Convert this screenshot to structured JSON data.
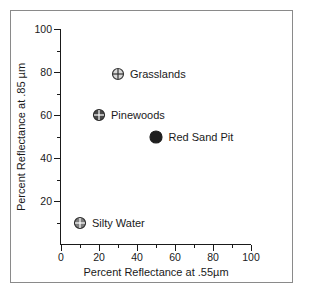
{
  "chart_data": {
    "type": "scatter",
    "title": "",
    "xlabel": "Percent Reflectance at .55µm",
    "ylabel": "Percent Reflectance at .85 µm",
    "xlim": [
      0,
      100
    ],
    "ylim": [
      0,
      100
    ],
    "grid": false,
    "legend": "inline-labels",
    "xticks": [
      {
        "value": 0,
        "label": "0"
      },
      {
        "value": 20,
        "label": "20"
      },
      {
        "value": 40,
        "label": "40"
      },
      {
        "value": 60,
        "label": "60"
      },
      {
        "value": 80,
        "label": "80"
      },
      {
        "value": 100,
        "label": "100"
      }
    ],
    "xticks_minor": [
      10,
      30,
      50,
      70,
      90
    ],
    "yticks": [
      {
        "value": 20,
        "label": "20"
      },
      {
        "value": 40,
        "label": "40"
      },
      {
        "value": 60,
        "label": "60"
      },
      {
        "value": 80,
        "label": "80"
      },
      {
        "value": 100,
        "label": "100"
      }
    ],
    "yticks_minor": [
      10,
      30,
      50,
      70,
      90
    ],
    "points": [
      {
        "label": "Grasslands",
        "x": 30,
        "y": 79,
        "style": "open-crosshair",
        "fill": "#d9d9d9",
        "stroke": "#333333",
        "radius": 6
      },
      {
        "label": "Pinewoods",
        "x": 20,
        "y": 60,
        "style": "filled-crosshair",
        "fill": "#4a4a4a",
        "stroke": "#2b2b2b",
        "radius": 6
      },
      {
        "label": "Red Sand Pit",
        "x": 50,
        "y": 50,
        "style": "solid",
        "fill": "#1f1f1f",
        "stroke": "#1f1f1f",
        "radius": 6.5
      },
      {
        "label": "Silty Water",
        "x": 10,
        "y": 10,
        "style": "filled-crosshair",
        "fill": "#7d7d7d",
        "stroke": "#2b2b2b",
        "radius": 6
      }
    ]
  },
  "colors": {
    "axis": "#1a1a1a",
    "frame": "#8a8a8a",
    "background": "#ffffff",
    "text": "#1a1a1a"
  }
}
